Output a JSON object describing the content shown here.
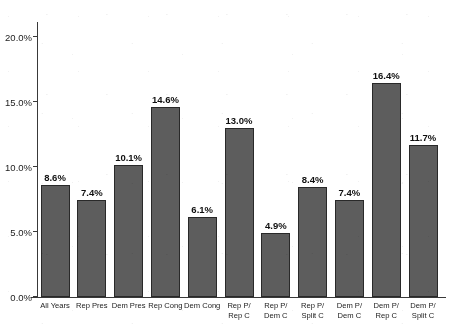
{
  "chart_data": {
    "type": "bar",
    "title": "...UNEMPLOYMENT RATE AVERAGE SINCE 1949-2019",
    "title_truncated": true,
    "xlabel": "",
    "ylabel": "",
    "ylim": [
      0.0,
      20.0
    ],
    "ytick_labels": [
      "0.0%",
      "5.0%",
      "10.0%",
      "15.0%",
      "20.0%"
    ],
    "ytick_values": [
      0.0,
      5.0,
      10.0,
      15.0,
      20.0
    ],
    "grid": false,
    "legend": "none",
    "bar_color": "#5e5e5e",
    "bar_edge_color": "#2b2b2b",
    "categories": [
      "All Years",
      "Rep Pres",
      "Dem Pres",
      "Rep Cong",
      "Dem Cong",
      "Rep P/\nRep C",
      "Rep P/\nDem C",
      "Rep P/\nSplit C",
      "Dem P/\nDem C",
      "Dem P/\nRep C",
      "Dem P/\nSplit C"
    ],
    "values": [
      8.6,
      7.4,
      10.1,
      14.6,
      6.1,
      13.0,
      4.9,
      8.4,
      7.4,
      16.4,
      11.7
    ],
    "value_labels": [
      "8.6%",
      "7.4%",
      "10.1%",
      "14.6%",
      "6.1%",
      "13.0%",
      "4.9%",
      "8.4%",
      "7.4%",
      "16.4%",
      "11.7%"
    ]
  }
}
